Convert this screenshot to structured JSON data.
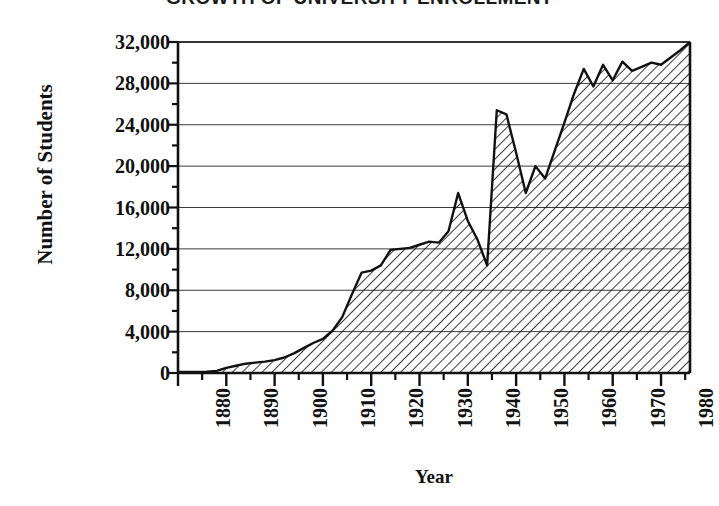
{
  "chart_data": {
    "type": "area",
    "title": "GROWTH OF UNIVERSITY ENROLLMENT",
    "xlabel": "Year",
    "ylabel": "Number of Students",
    "xlim": [
      1880,
      1986
    ],
    "ylim": [
      0,
      32000
    ],
    "grid": true,
    "grid_axis": "y",
    "legend": false,
    "fill_pattern": "diagonal-hatch",
    "y_ticks": [
      0,
      4000,
      8000,
      12000,
      16000,
      20000,
      24000,
      28000,
      32000
    ],
    "y_tick_labels": [
      "0",
      "4,000",
      "8,000",
      "12,000",
      "16,000",
      "20,000",
      "24,000",
      "28,000",
      "32,000"
    ],
    "y_minor_tick_step": 2000,
    "x_ticks": [
      1880,
      1890,
      1900,
      1910,
      1920,
      1930,
      1940,
      1950,
      1960,
      1970,
      1980
    ],
    "x_tick_labels": [
      "1880",
      "1890",
      "1900",
      "1910",
      "1920",
      "1930",
      "1940",
      "1950",
      "1960",
      "1970",
      "1980"
    ],
    "x_minor_tick_step": 5,
    "series_name": "Number of Students",
    "x": [
      1880,
      1882,
      1884,
      1886,
      1888,
      1890,
      1892,
      1894,
      1896,
      1898,
      1900,
      1902,
      1904,
      1906,
      1908,
      1910,
      1912,
      1914,
      1916,
      1918,
      1920,
      1922,
      1924,
      1926,
      1928,
      1930,
      1932,
      1934,
      1936,
      1938,
      1940,
      1942,
      1944,
      1946,
      1948,
      1950,
      1952,
      1954,
      1956,
      1958,
      1960,
      1962,
      1964,
      1966,
      1968,
      1970,
      1972,
      1974,
      1976,
      1978,
      1980,
      1982,
      1984,
      1986
    ],
    "values": [
      100,
      100,
      100,
      120,
      200,
      500,
      700,
      900,
      1000,
      1100,
      1250,
      1500,
      1900,
      2400,
      2900,
      3300,
      4100,
      5400,
      7600,
      9700,
      9900,
      10400,
      11900,
      12000,
      12100,
      12400,
      12700,
      12600,
      13700,
      17400,
      14700,
      12900,
      10400,
      25400,
      25000,
      21300,
      17400,
      20000,
      18800,
      21500,
      24200,
      27000,
      29400,
      27700,
      29800,
      28300,
      30100,
      29200,
      29600,
      30000,
      29800,
      30500,
      31200,
      32000
    ],
    "annotations": []
  }
}
